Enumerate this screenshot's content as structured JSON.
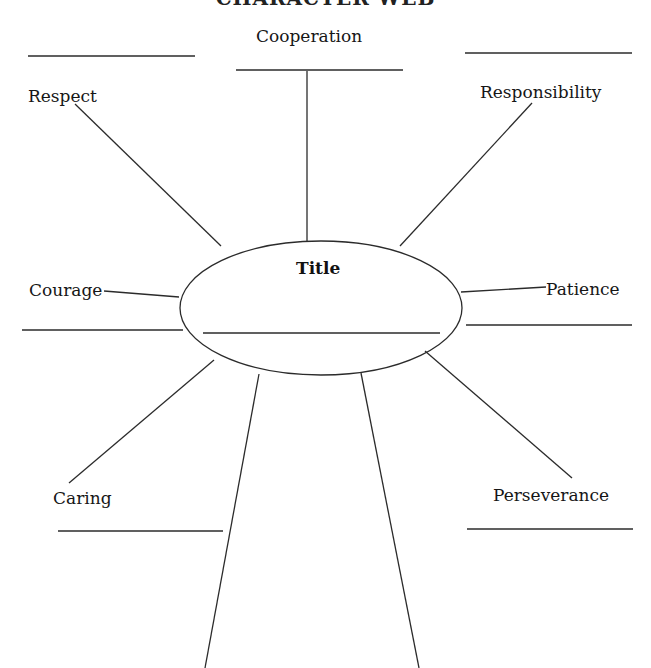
{
  "header": {
    "text": "CHARACTER WEB"
  },
  "center": {
    "title": "Title"
  },
  "traits": {
    "cooperation": "Cooperation",
    "respect": "Respect",
    "responsibility": "Responsibility",
    "courage": "Courage",
    "patience": "Patience",
    "caring": "Caring",
    "perseverance": "Perseverance"
  },
  "colors": {
    "ink": "#2b2b2b",
    "background": "#ffffff"
  }
}
